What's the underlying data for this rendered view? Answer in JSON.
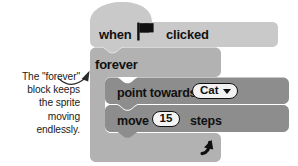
{
  "annotation": {
    "lines": [
      "The \"forever\"",
      "block keeps",
      "the sprite",
      "moving",
      "endlessly."
    ],
    "arrow_icon": "curved-arrow-up-right"
  },
  "script": {
    "hat_block": {
      "label_before": "when",
      "icon": "green-flag-icon",
      "label_after": "clicked",
      "color": "#c9c9c9"
    },
    "forever_block": {
      "label": "forever",
      "loop_icon": "loop-arrow-icon",
      "color": "#b2b2b2"
    },
    "inner_blocks": [
      {
        "label": "point towards",
        "input_type": "dropdown",
        "value": "Cat",
        "caret": "▾",
        "color": "#8d8d8d"
      },
      {
        "label_before": "move",
        "input_type": "number",
        "value": "15",
        "label_after": "steps",
        "color": "#8d8d8d"
      }
    ]
  },
  "colors": {
    "background": "#ffffff",
    "hat_block": "#c9c9c9",
    "control_block": "#b2b2b2",
    "motion_block": "#8d8d8d",
    "text": "#111111",
    "annotation_text": "#1a1a1a",
    "input_fill": "#f2f2f2",
    "input_border": "#101010"
  }
}
